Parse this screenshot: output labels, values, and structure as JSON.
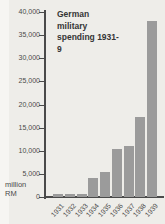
{
  "page": {
    "background_color": "#eeede9",
    "edge_strip_color": "#f6f5f2"
  },
  "chart_data": {
    "type": "bar",
    "title": "German military spending 1931-9",
    "unit_label_line1": "million",
    "unit_label_line2": "RM",
    "categories": [
      "1931",
      "1932",
      "1933",
      "1934",
      "1935",
      "1936",
      "1937",
      "1938",
      "1939"
    ],
    "values": [
      610,
      720,
      750,
      4100,
      5500,
      10300,
      11000,
      17200,
      38000
    ],
    "ylim": [
      0,
      40000
    ],
    "ytick_interval": 5000,
    "ytick_labels": [
      "40,000",
      "35,000",
      "30,000",
      "25,000",
      "20,000",
      "15,000",
      "10,000",
      "5,000",
      "0"
    ],
    "xlabel": "",
    "ylabel": "million RM",
    "grid": false,
    "legend": false,
    "bar_color": "#9b9b9b",
    "axis_color": "#4a4a4a",
    "tick_label_color": "#4a4a4a",
    "title_color": "#353535"
  }
}
